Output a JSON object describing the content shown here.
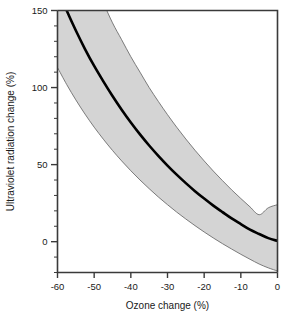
{
  "chart_data": {
    "type": "line",
    "title": "",
    "xlabel": "Ozone change (%)",
    "ylabel": "Ultraviolet radiation change (%)",
    "xlim": [
      -60,
      0
    ],
    "ylim": [
      -20,
      150
    ],
    "y_axis_display_min": 0,
    "grid": false,
    "legend": "none",
    "x_ticks": [
      -60,
      -50,
      -40,
      -30,
      -20,
      -10,
      0
    ],
    "x_tick_labels": [
      "-60",
      "-50",
      "-40",
      "-30",
      "-20",
      "-10",
      "0"
    ],
    "x_minor_tick_interval": 10,
    "y_ticks": [
      0,
      50,
      100,
      150
    ],
    "y_tick_labels": [
      "0",
      "50",
      "100",
      "150"
    ],
    "y_minor_tick_interval": 10,
    "series": [
      {
        "name": "Central estimate",
        "style": "solid-thick-black",
        "x": [
          -60,
          -57.5,
          -55,
          -52.5,
          -50,
          -47.5,
          -45,
          -42.5,
          -40,
          -37.5,
          -35,
          -32.5,
          -30,
          -27.5,
          -25,
          -22.5,
          -20,
          -17.5,
          -15,
          -12.5,
          -10,
          -7.5,
          -5,
          -2.5,
          0
        ],
        "y": [
          164,
          150,
          137,
          125,
          114,
          104,
          94.5,
          85.6,
          77.3,
          69.6,
          62.4,
          55.7,
          49.4,
          43.5,
          38.0,
          32.8,
          28.0,
          23.4,
          19.2,
          15.1,
          11.4,
          7.8,
          5.0,
          2.3,
          0.5
        ]
      },
      {
        "name": "Upper uncertainty bound",
        "style": "shaded-band-edge",
        "x": [
          -60,
          -57.5,
          -55,
          -52.5,
          -50,
          -47.5,
          -45,
          -42.5,
          -40,
          -37.5,
          -35,
          -32.5,
          -30,
          -27.5,
          -25,
          -22.5,
          -20,
          -17.5,
          -15,
          -12.5,
          -10,
          -7.5,
          -5,
          -2.5,
          0
        ],
        "y": [
          232,
          214,
          197,
          182,
          168,
          155,
          142,
          131,
          120,
          110,
          100,
          91.0,
          82.4,
          74.3,
          66.6,
          59.3,
          52.4,
          45.8,
          39.6,
          33.6,
          28.0,
          22.6,
          17.5,
          22.0,
          24.0
        ]
      },
      {
        "name": "Lower uncertainty bound",
        "style": "shaded-band-edge",
        "x": [
          -60,
          -57.5,
          -55,
          -52.5,
          -50,
          -47.5,
          -45,
          -42.5,
          -40,
          -37.5,
          -35,
          -32.5,
          -30,
          -27.5,
          -25,
          -22.5,
          -20,
          -17.5,
          -15,
          -12.5,
          -10,
          -7.5,
          -5,
          -2.5,
          0
        ],
        "y": [
          113,
          102,
          92,
          82.8,
          74.3,
          66.5,
          59.2,
          52.4,
          46.0,
          40.0,
          34.4,
          29.0,
          24.0,
          19.2,
          14.7,
          10.4,
          6.3,
          2.4,
          -1.3,
          -4.8,
          -8.2,
          -11.4,
          -14.5,
          -17.0,
          -19.0
        ]
      }
    ],
    "band_fill_color": "#d4d4d4",
    "band_edge_color": "#6e6e6e",
    "line_color": "#000000",
    "axis_color": "#3a3a3a",
    "annotations": []
  },
  "figure": {
    "background": "#ffffff"
  }
}
